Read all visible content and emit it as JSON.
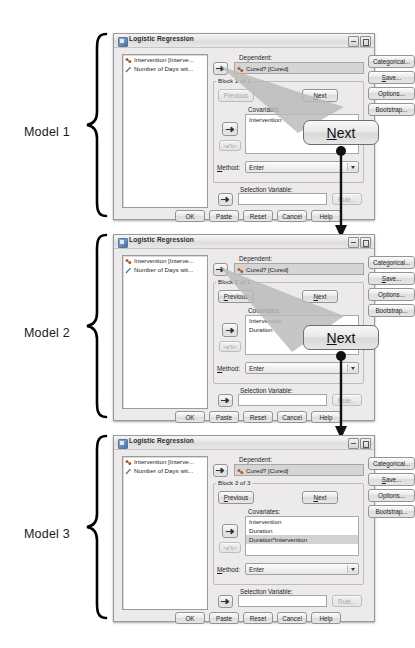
{
  "page": {
    "width": 388,
    "height": 648
  },
  "dialog_defaults": {
    "window_title": "Logistic Regression",
    "variable_list": [
      {
        "label": "Intervention [Interve...",
        "icon": "nominal-variable-icon"
      },
      {
        "label": "Number of Days wit...",
        "icon": "scale-variable-icon"
      }
    ],
    "dependent_label": "Dependent:",
    "dependent_value": "Cured? [Cured]",
    "previous_label": "Previous",
    "next_label": "Next",
    "covariates_label": "Covariates:",
    "interaction_label": ">a*b>",
    "method_label": "Method:",
    "method_value": "Enter",
    "selection_variable_label": "Selection Variable:",
    "selection_variable_value": "",
    "rule_label": "Rule...",
    "side_buttons": [
      {
        "label": "Categorical...",
        "name": "categorical-button"
      },
      {
        "label": "Save...",
        "label_html": "<u>S</u>ave...",
        "name": "save-button"
      },
      {
        "label": "Options...",
        "name": "options-button"
      },
      {
        "label": "Bootstrap...",
        "name": "bootstrap-button"
      }
    ],
    "bottom_buttons": [
      {
        "label": "OK",
        "name": "ok-button"
      },
      {
        "label": "Paste",
        "name": "paste-button"
      },
      {
        "label": "Reset",
        "name": "reset-button"
      },
      {
        "label": "Cancel",
        "name": "cancel-button"
      },
      {
        "label": "Help",
        "name": "help-button"
      }
    ]
  },
  "models": [
    {
      "model_label": "Model 1",
      "block_label": "Block 1 of 1",
      "previous_enabled": false,
      "covariates": [
        "Intervention"
      ],
      "selected_covariate_index": -1
    },
    {
      "model_label": "Model 2",
      "block_label": "Block 2 of 2",
      "previous_enabled": true,
      "covariates": [
        "Intervention",
        "Duration"
      ],
      "selected_covariate_index": -1
    },
    {
      "model_label": "Model 3",
      "block_label": "Block 3 of 3",
      "previous_enabled": true,
      "covariates": [
        "Intervention",
        "Duration",
        "Duration*Intervention"
      ],
      "selected_covariate_index": 2
    }
  ],
  "callouts": [
    {
      "label": "Next",
      "underline_letter": "N",
      "after_model": 1
    },
    {
      "label": "Next",
      "underline_letter": "N",
      "after_model": 2
    }
  ],
  "colors": {
    "dialog_background": "#eceaea",
    "dialog_border": "#9a9a9a",
    "field_background": "#d6d4d4",
    "list_background": "#ffffff",
    "selection_highlight": "#d2d2d2",
    "text": "#1e1e1e",
    "disabled_text": "#a6a6a6",
    "callout_border": "#6e6e6e"
  }
}
